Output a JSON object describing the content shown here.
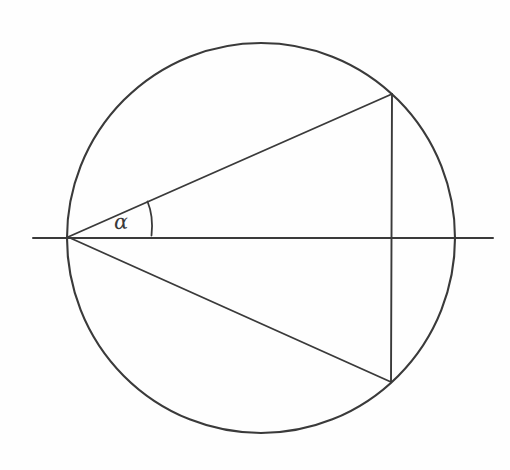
{
  "figure": {
    "kind": "geometry-diagram",
    "title_text": "",
    "background_color": "#fefefe",
    "ink_color": "#3a3a3a",
    "canvas": {
      "width": 510,
      "height": 470
    }
  },
  "labels": {
    "angle_alpha": "α"
  },
  "chart_data": {
    "type": "diagram",
    "title": "",
    "xlabel": "",
    "ylabel": "",
    "elements": [
      {
        "name": "circle",
        "shape": "ellipse",
        "cx": 261,
        "cy": 238,
        "rx": 194,
        "ry": 195,
        "stroke": "#3a3a3a",
        "stroke_width": 2.1,
        "fill": "none"
      },
      {
        "name": "horizontal-axis-line",
        "shape": "line",
        "x1": 33,
        "y1": 238,
        "x2": 493,
        "y2": 238,
        "stroke": "#3a3a3a",
        "stroke_width": 2.0
      },
      {
        "name": "upper-triangle-side",
        "shape": "line",
        "x1": 68,
        "y1": 237,
        "x2": 392,
        "y2": 94,
        "stroke": "#3a3a3a",
        "stroke_width": 1.9
      },
      {
        "name": "lower-triangle-side",
        "shape": "line",
        "x1": 68,
        "y1": 237,
        "x2": 391,
        "y2": 382,
        "stroke": "#3a3a3a",
        "stroke_width": 1.9
      },
      {
        "name": "vertical-chord",
        "shape": "line",
        "x1": 392,
        "y1": 94,
        "x2": 391,
        "y2": 382,
        "stroke": "#3a3a3a",
        "stroke_width": 1.9
      },
      {
        "name": "angle-arc-marker",
        "shape": "arc",
        "path": "M 147.5 201.5 C 151.5 211 152.8 224 151.5 235.5",
        "stroke": "#3a3a3a",
        "stroke_width": 1.8
      }
    ],
    "points": [
      {
        "name": "apex-left-vertex",
        "x": 68,
        "y": 237,
        "label": ""
      },
      {
        "name": "upper-vertex",
        "x": 392,
        "y": 94,
        "label": ""
      },
      {
        "name": "lower-vertex",
        "x": 391,
        "y": 382,
        "label": ""
      },
      {
        "name": "chord-axis-intersection",
        "x": 391,
        "y": 238,
        "label": ""
      },
      {
        "name": "circle-right-extreme",
        "x": 455,
        "y": 238,
        "label": ""
      }
    ],
    "annotations": [
      {
        "name": "alpha-angle-label",
        "text": "α",
        "x": 123,
        "y": 224,
        "font_size": 21,
        "italic": true
      }
    ]
  }
}
